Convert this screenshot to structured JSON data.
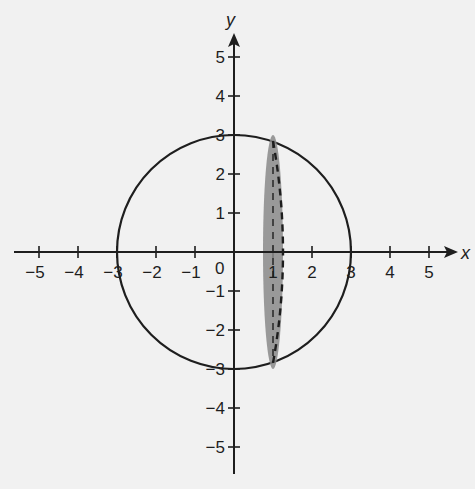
{
  "figure": {
    "type": "coordinate-plane-diagram",
    "background": "#f1f1f1",
    "ink_color": "#1e1e1e",
    "shade_color": "#8a8a8a",
    "axes": {
      "x_label": "x",
      "y_label": "y",
      "origin_label": "0",
      "x_range": [
        -5,
        5
      ],
      "y_range": [
        -5,
        5
      ],
      "x_ticks": [
        {
          "value": -5,
          "label": "−5"
        },
        {
          "value": -4,
          "label": "−4"
        },
        {
          "value": -3,
          "label": "−3"
        },
        {
          "value": -2,
          "label": "−2"
        },
        {
          "value": -1,
          "label": "−1"
        },
        {
          "value": 1,
          "label": "1"
        },
        {
          "value": 2,
          "label": "2"
        },
        {
          "value": 3,
          "label": "3"
        },
        {
          "value": 4,
          "label": "4"
        },
        {
          "value": 5,
          "label": "5"
        }
      ],
      "y_ticks": [
        {
          "value": 5,
          "label": "5"
        },
        {
          "value": 4,
          "label": "4"
        },
        {
          "value": 3,
          "label": "3"
        },
        {
          "value": 2,
          "label": "2"
        },
        {
          "value": 1,
          "label": "1"
        },
        {
          "value": -1,
          "label": "−1"
        },
        {
          "value": -2,
          "label": "−2"
        },
        {
          "value": -3,
          "label": "−3"
        },
        {
          "value": -4,
          "label": "−4"
        },
        {
          "value": -5,
          "label": "−5"
        }
      ]
    },
    "shapes": {
      "circle": {
        "center": [
          0,
          0
        ],
        "radius": 3,
        "style": "solid"
      },
      "cross_section": {
        "description": "shaded elliptical cross-section at x = 1, chord from y ≈ −2.83 to y ≈ 2.83",
        "x": 1,
        "half_height": 2.83,
        "fill": "shaded gray",
        "back_edge": "solid (left half, hidden under fill)",
        "front_edge": "dashed (right half)"
      }
    }
  }
}
